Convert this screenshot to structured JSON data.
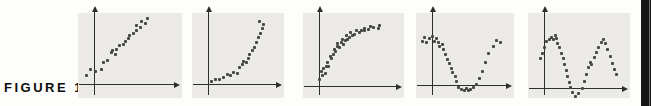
{
  "figure": {
    "label": "FIGURE 1"
  },
  "colors": {
    "panel_bg": "#ebeae6",
    "axis": "#2e2e2e",
    "point": "#474747",
    "label": "#0b0b0b",
    "page_edge": "#161616",
    "page_edge_highlight": "#6d6d6d",
    "background": "#fdfdfb"
  },
  "chart_data": [
    {
      "type": "scatter",
      "name": "plot-1",
      "pattern": "linear-increasing",
      "title": "",
      "xlabel": "",
      "ylabel": "",
      "axis_arrows": true,
      "grid": false,
      "units": "normalized-to-axes (origin at axis crossing, x right 0-1, y up 0-1)",
      "points": [
        [
          -0.1,
          0.13
        ],
        [
          -0.05,
          0.21
        ],
        [
          0.02,
          0.19
        ],
        [
          0.09,
          0.22
        ],
        [
          0.12,
          0.31
        ],
        [
          0.17,
          0.35
        ],
        [
          0.22,
          0.46
        ],
        [
          0.24,
          0.49
        ],
        [
          0.28,
          0.43
        ],
        [
          0.29,
          0.51
        ],
        [
          0.33,
          0.57
        ],
        [
          0.38,
          0.58
        ],
        [
          0.41,
          0.62
        ],
        [
          0.44,
          0.67
        ],
        [
          0.46,
          0.71
        ],
        [
          0.5,
          0.74
        ],
        [
          0.54,
          0.78
        ],
        [
          0.55,
          0.86
        ],
        [
          0.6,
          0.83
        ],
        [
          0.61,
          0.92
        ],
        [
          0.66,
          0.89
        ],
        [
          0.68,
          0.96
        ]
      ]
    },
    {
      "type": "scatter",
      "name": "plot-2",
      "pattern": "exponential-increasing-concave-up",
      "title": "",
      "xlabel": "",
      "ylabel": "",
      "axis_arrows": true,
      "grid": false,
      "units": "normalized-to-axes (origin at axis crossing, x right 0-1, y up 0-1)",
      "points": [
        [
          0.05,
          0.04
        ],
        [
          0.12,
          0.07
        ],
        [
          0.18,
          0.06
        ],
        [
          0.24,
          0.1
        ],
        [
          0.29,
          0.14
        ],
        [
          0.34,
          0.12
        ],
        [
          0.39,
          0.17
        ],
        [
          0.45,
          0.15
        ],
        [
          0.47,
          0.24
        ],
        [
          0.53,
          0.29
        ],
        [
          0.54,
          0.33
        ],
        [
          0.58,
          0.32
        ],
        [
          0.61,
          0.38
        ],
        [
          0.63,
          0.43
        ],
        [
          0.67,
          0.49
        ],
        [
          0.7,
          0.54
        ],
        [
          0.74,
          0.61
        ],
        [
          0.76,
          0.68
        ],
        [
          0.79,
          0.75
        ],
        [
          0.82,
          0.82
        ],
        [
          0.84,
          0.88
        ],
        [
          0.78,
          0.92
        ]
      ]
    },
    {
      "type": "scatter",
      "name": "plot-3",
      "pattern": "logarithmic-increasing-concave-down",
      "title": "",
      "xlabel": "",
      "ylabel": "",
      "axis_arrows": true,
      "grid": false,
      "units": "normalized-to-axes (origin at axis crossing, x right 0-1, y up 0-1)",
      "points": [
        [
          0.01,
          0.1
        ],
        [
          0.05,
          0.15
        ],
        [
          0.03,
          0.21
        ],
        [
          0.08,
          0.19
        ],
        [
          0.06,
          0.26
        ],
        [
          0.1,
          0.29
        ],
        [
          0.13,
          0.28
        ],
        [
          0.11,
          0.35
        ],
        [
          0.16,
          0.4
        ],
        [
          0.15,
          0.44
        ],
        [
          0.19,
          0.47
        ],
        [
          0.22,
          0.51
        ],
        [
          0.2,
          0.54
        ],
        [
          0.24,
          0.58
        ],
        [
          0.27,
          0.56
        ],
        [
          0.25,
          0.63
        ],
        [
          0.3,
          0.64
        ],
        [
          0.32,
          0.61
        ],
        [
          0.31,
          0.68
        ],
        [
          0.35,
          0.67
        ],
        [
          0.38,
          0.69
        ],
        [
          0.36,
          0.74
        ],
        [
          0.41,
          0.72
        ],
        [
          0.44,
          0.75
        ],
        [
          0.42,
          0.78
        ],
        [
          0.47,
          0.76
        ],
        [
          0.5,
          0.81
        ],
        [
          0.54,
          0.79
        ],
        [
          0.56,
          0.82
        ],
        [
          0.6,
          0.82
        ],
        [
          0.61,
          0.85
        ],
        [
          0.66,
          0.83
        ],
        [
          0.69,
          0.88
        ],
        [
          0.72,
          0.86
        ],
        [
          0.79,
          0.85
        ],
        [
          0.81,
          0.89
        ]
      ]
    },
    {
      "type": "scatter",
      "name": "plot-4",
      "pattern": "u-shaped-valley",
      "title": "",
      "xlabel": "",
      "ylabel": "",
      "axis_arrows": true,
      "grid": false,
      "units": "normalized-to-axes (origin at axis crossing, x right 0-1, y up 0-1)",
      "points": [
        [
          -0.13,
          0.64
        ],
        [
          -0.1,
          0.7
        ],
        [
          -0.07,
          0.62
        ],
        [
          -0.04,
          0.68
        ],
        [
          0.0,
          0.72
        ],
        [
          0.03,
          0.64
        ],
        [
          0.06,
          0.68
        ],
        [
          0.09,
          0.62
        ],
        [
          0.11,
          0.56
        ],
        [
          0.14,
          0.6
        ],
        [
          0.16,
          0.52
        ],
        [
          0.19,
          0.45
        ],
        [
          0.22,
          0.38
        ],
        [
          0.24,
          0.32
        ],
        [
          0.27,
          0.25
        ],
        [
          0.29,
          0.18
        ],
        [
          0.32,
          0.12
        ],
        [
          0.34,
          0.05
        ],
        [
          0.37,
          -0.03
        ],
        [
          0.41,
          -0.06
        ],
        [
          0.45,
          -0.08
        ],
        [
          0.48,
          -0.05
        ],
        [
          0.51,
          -0.08
        ],
        [
          0.54,
          -0.06
        ],
        [
          0.58,
          -0.04
        ],
        [
          0.62,
          0.01
        ],
        [
          0.66,
          0.09
        ],
        [
          0.7,
          0.2
        ],
        [
          0.74,
          0.33
        ],
        [
          0.79,
          0.46
        ],
        [
          0.85,
          0.57
        ],
        [
          0.9,
          0.65
        ],
        [
          0.95,
          0.62
        ]
      ]
    },
    {
      "type": "scatter",
      "name": "plot-5",
      "pattern": "cyclic-two-peaks-sinusoidal",
      "title": "",
      "xlabel": "",
      "ylabel": "",
      "axis_arrows": true,
      "grid": false,
      "units": "normalized-to-axes (origin at axis crossing, x right 0-1, y up 0-1)",
      "points": [
        [
          -0.05,
          0.43
        ],
        [
          -0.02,
          0.51
        ],
        [
          0.01,
          0.59
        ],
        [
          0.03,
          0.69
        ],
        [
          0.07,
          0.71
        ],
        [
          0.1,
          0.74
        ],
        [
          0.13,
          0.71
        ],
        [
          0.15,
          0.77
        ],
        [
          0.17,
          0.73
        ],
        [
          0.18,
          0.66
        ],
        [
          0.2,
          0.59
        ],
        [
          0.23,
          0.51
        ],
        [
          0.25,
          0.43
        ],
        [
          0.27,
          0.35
        ],
        [
          0.29,
          0.26
        ],
        [
          0.31,
          0.17
        ],
        [
          0.33,
          0.08
        ],
        [
          0.35,
          0.01
        ],
        [
          0.38,
          -0.06
        ],
        [
          0.41,
          -0.12
        ],
        [
          0.45,
          -0.08
        ],
        [
          0.5,
          0.0
        ],
        [
          0.53,
          0.1
        ],
        [
          0.56,
          0.2
        ],
        [
          0.59,
          0.3
        ],
        [
          0.61,
          0.38
        ],
        [
          0.63,
          0.34
        ],
        [
          0.66,
          0.45
        ],
        [
          0.69,
          0.52
        ],
        [
          0.72,
          0.6
        ],
        [
          0.75,
          0.67
        ],
        [
          0.78,
          0.71
        ],
        [
          0.81,
          0.65
        ],
        [
          0.84,
          0.57
        ],
        [
          0.87,
          0.47
        ],
        [
          0.9,
          0.36
        ],
        [
          0.93,
          0.27
        ],
        [
          0.95,
          0.2
        ]
      ]
    }
  ]
}
